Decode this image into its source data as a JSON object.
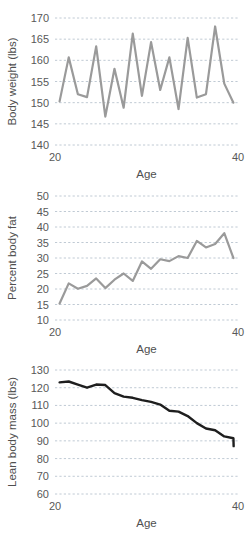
{
  "figure": {
    "background_color": "#ffffff",
    "panel_count": 3
  },
  "chart_data": [
    {
      "type": "line",
      "title": "",
      "xlabel": "Age",
      "ylabel": "Body weight (lbs)",
      "xlim": [
        20,
        40
      ],
      "ylim": [
        140,
        170
      ],
      "xticks": [
        20,
        40
      ],
      "xtick_labels": [
        "20",
        "40"
      ],
      "yticks": [
        140,
        145,
        150,
        155,
        160,
        165,
        170
      ],
      "ytick_labels": [
        "140",
        "145",
        "150",
        "155",
        "160",
        "165",
        "170"
      ],
      "grid": true,
      "grid_axis": "y",
      "grid_color": "#b9c4cf",
      "line_color": "#9a9a9a",
      "line_width": 2.2,
      "legend": false,
      "x": [
        20.5,
        21.5,
        22.5,
        23.5,
        24.5,
        25.5,
        26.5,
        27.5,
        28.5,
        29.5,
        30.5,
        31.5,
        32.5,
        33.5,
        34.5,
        35.5,
        36.5,
        37.5,
        38.5,
        39.5
      ],
      "values": [
        150.3,
        160.7,
        152.0,
        151.3,
        163.3,
        146.7,
        158.0,
        148.8,
        166.3,
        151.6,
        164.3,
        153.0,
        160.7,
        148.5,
        165.3,
        151.2,
        152.0,
        168.0,
        154.5,
        150.0
      ]
    },
    {
      "type": "line",
      "title": "",
      "xlabel": "Age",
      "ylabel": "Percent body fat",
      "xlim": [
        20,
        40
      ],
      "ylim": [
        10,
        50
      ],
      "xticks": [
        20,
        40
      ],
      "xtick_labels": [
        "20",
        "40"
      ],
      "yticks": [
        10,
        15,
        20,
        25,
        30,
        35,
        40,
        45,
        50
      ],
      "ytick_labels": [
        "10",
        "15",
        "20",
        "25",
        "30",
        "35",
        "40",
        "45",
        "50"
      ],
      "grid": true,
      "grid_axis": "y",
      "grid_color": "#b9c4cf",
      "line_color": "#9a9a9a",
      "line_width": 2.2,
      "legend": false,
      "x": [
        20.5,
        21.5,
        22.5,
        23.5,
        24.5,
        25.5,
        26.5,
        27.5,
        28.5,
        29.5,
        30.5,
        31.5,
        32.5,
        33.5,
        34.5,
        35.5,
        36.5,
        37.5,
        38.5,
        39.5
      ],
      "values": [
        15.3,
        21.8,
        20.1,
        21.0,
        23.4,
        20.3,
        23.0,
        25.0,
        22.6,
        28.9,
        26.5,
        29.6,
        29.0,
        30.6,
        30.0,
        35.5,
        33.4,
        34.5,
        38.0,
        30.0
      ]
    },
    {
      "type": "line",
      "title": "",
      "xlabel": "Age",
      "ylabel": "Lean body mass (lbs)",
      "xlim": [
        20,
        40
      ],
      "ylim": [
        60,
        130
      ],
      "xticks": [
        20,
        40
      ],
      "xtick_labels": [
        "20",
        "40"
      ],
      "yticks": [
        60,
        70,
        80,
        90,
        100,
        110,
        120,
        130
      ],
      "ytick_labels": [
        "60",
        "70",
        "80",
        "90",
        "100",
        "110",
        "120",
        "130"
      ],
      "grid": true,
      "grid_axis": "y",
      "grid_color": "#b9c4cf",
      "line_color": "#1e1e1e",
      "line_width": 2.4,
      "legend": false,
      "x": [
        20.5,
        21.5,
        22.5,
        23.5,
        24.5,
        25.5,
        26.5,
        27.5,
        28.5,
        29.5,
        30.5,
        31.5,
        32.5,
        33.5,
        34.5,
        35.5,
        36.5,
        37.5,
        38.5,
        39.5
      ],
      "values": [
        123.0,
        123.5,
        121.8,
        120.0,
        121.8,
        121.5,
        117.0,
        115.0,
        114.3,
        113.0,
        112.0,
        110.5,
        107.0,
        106.5,
        104.0,
        100.0,
        97.0,
        96.0,
        92.5,
        91.5,
        87.0
      ]
    }
  ]
}
